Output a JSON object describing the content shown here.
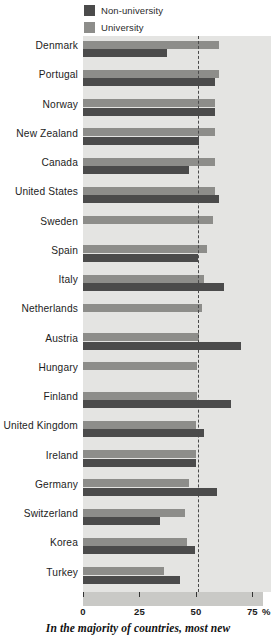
{
  "legend": {
    "items": [
      {
        "label": "Non-university",
        "color": "#4b4b4b",
        "key": "nonuniversity"
      },
      {
        "label": "University",
        "color": "#8d8d8a",
        "key": "university"
      }
    ]
  },
  "axis": {
    "unit": "%",
    "ticks": [
      "0",
      "25",
      "50",
      "75"
    ]
  },
  "caption": "In the majority of countries, most new",
  "chart_data": {
    "type": "bar",
    "orientation": "horizontal",
    "title": "",
    "subtitle": "",
    "xlabel": "%",
    "ylabel": "",
    "xlim": [
      0,
      80
    ],
    "grid": false,
    "legend_position": "top",
    "reference_line": {
      "value": 50,
      "style": "dashed",
      "color": "#4a4a4a"
    },
    "categories": [
      "Denmark",
      "Portugal",
      "Norway",
      "New Zealand",
      "Canada",
      "United States",
      "Sweden",
      "Spain",
      "Italy",
      "Netherlands",
      "Austria",
      "Hungary",
      "Finland",
      "United Kingdom",
      "Ireland",
      "Germany",
      "Switzerland",
      "Korea",
      "Turkey"
    ],
    "series": [
      {
        "name": "University",
        "color": "#8d8d8a",
        "values": [
          60,
          60,
          58.5,
          58.5,
          58.5,
          58.5,
          57.5,
          55,
          53.5,
          52.5,
          51.5,
          50.5,
          50.5,
          50,
          50,
          47,
          45,
          46,
          36
        ]
      },
      {
        "name": "Non-university",
        "color": "#4b4b4b",
        "values": [
          37,
          58.5,
          58.5,
          51.5,
          47,
          60,
          0,
          51,
          62.5,
          0,
          70,
          0,
          65.5,
          53.5,
          50,
          59.5,
          34,
          49.5,
          43
        ]
      }
    ]
  }
}
